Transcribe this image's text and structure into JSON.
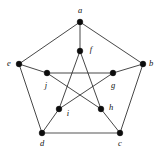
{
  "figure": {
    "width": 161,
    "height": 150,
    "background_color": "#ffffff"
  },
  "style": {
    "edge_color": "#262626",
    "edge_light_color": "#8d8d8d",
    "vertex_color": "#0d0d0d",
    "label_color": "#111111",
    "vertex_radius": 2.9,
    "edge_width": 0.85,
    "edge_light_width": 1.6
  },
  "chart_data": {
    "type": "diagram",
    "subtype": "graph",
    "vertex_count": 10,
    "edge_count": 15,
    "vertices": [
      {
        "id": "a",
        "label": "a",
        "x": 80,
        "y": 22,
        "label_x": 80,
        "label_y": 11,
        "label_anchor": "middle",
        "group": "outer"
      },
      {
        "id": "b",
        "label": "b",
        "x": 143,
        "y": 64,
        "label_x": 151,
        "label_y": 64,
        "label_anchor": "middle",
        "group": "outer"
      },
      {
        "id": "c",
        "label": "c",
        "x": 120,
        "y": 133,
        "label_x": 120,
        "label_y": 144,
        "label_anchor": "middle",
        "group": "outer"
      },
      {
        "id": "d",
        "label": "d",
        "x": 42,
        "y": 133,
        "label_x": 42,
        "label_y": 144,
        "label_anchor": "middle",
        "group": "outer"
      },
      {
        "id": "e",
        "label": "e",
        "x": 19,
        "y": 64,
        "label_x": 9,
        "label_y": 64,
        "label_anchor": "middle",
        "group": "outer"
      },
      {
        "id": "f",
        "label": "f",
        "x": 80,
        "y": 51,
        "label_x": 91,
        "label_y": 50,
        "label_anchor": "middle",
        "group": "inner"
      },
      {
        "id": "g",
        "label": "g",
        "x": 113,
        "y": 73,
        "label_x": 113,
        "label_y": 86,
        "label_anchor": "middle",
        "group": "inner"
      },
      {
        "id": "h",
        "label": "h",
        "x": 101,
        "y": 109,
        "label_x": 111,
        "label_y": 108,
        "label_anchor": "middle",
        "group": "inner"
      },
      {
        "id": "i",
        "label": "i",
        "x": 59,
        "y": 109,
        "label_x": 68,
        "label_y": 114,
        "label_anchor": "middle",
        "group": "inner"
      },
      {
        "id": "j",
        "label": "j",
        "x": 47,
        "y": 73,
        "label_x": 46,
        "label_y": 86,
        "label_anchor": "middle",
        "group": "inner"
      }
    ],
    "edges": [
      {
        "from": "a",
        "to": "b",
        "kind": "outer",
        "shade": "dark"
      },
      {
        "from": "b",
        "to": "c",
        "kind": "outer",
        "shade": "dark"
      },
      {
        "from": "c",
        "to": "d",
        "kind": "outer",
        "shade": "light"
      },
      {
        "from": "d",
        "to": "e",
        "kind": "outer",
        "shade": "dark"
      },
      {
        "from": "e",
        "to": "a",
        "kind": "outer",
        "shade": "dark"
      },
      {
        "from": "a",
        "to": "f",
        "kind": "spoke",
        "shade": "dark"
      },
      {
        "from": "b",
        "to": "g",
        "kind": "spoke",
        "shade": "dark"
      },
      {
        "from": "c",
        "to": "h",
        "kind": "spoke",
        "shade": "dark"
      },
      {
        "from": "d",
        "to": "i",
        "kind": "spoke",
        "shade": "dark"
      },
      {
        "from": "e",
        "to": "j",
        "kind": "spoke",
        "shade": "dark"
      },
      {
        "from": "f",
        "to": "h",
        "kind": "inner",
        "shade": "dark"
      },
      {
        "from": "h",
        "to": "j",
        "kind": "inner",
        "shade": "dark"
      },
      {
        "from": "j",
        "to": "g",
        "kind": "inner",
        "shade": "dark"
      },
      {
        "from": "g",
        "to": "i",
        "kind": "inner",
        "shade": "dark"
      },
      {
        "from": "i",
        "to": "f",
        "kind": "inner",
        "shade": "dark"
      }
    ]
  }
}
